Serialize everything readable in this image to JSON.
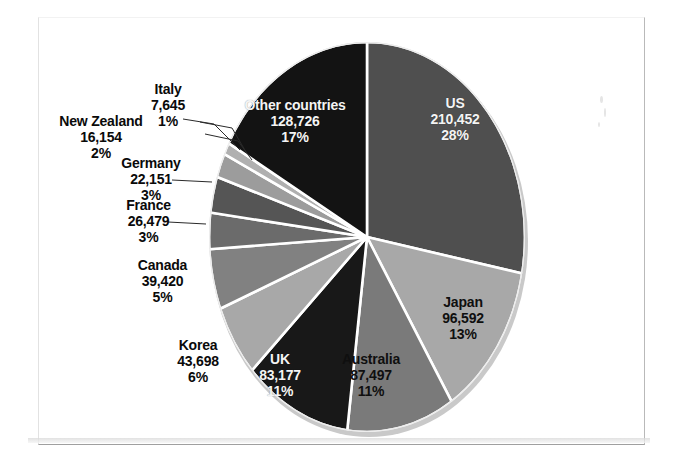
{
  "chart_data": {
    "type": "pie",
    "title": "",
    "subtitle": "",
    "xlabel": "",
    "ylabel": "",
    "legend_position": "none",
    "grid": false,
    "label_format": "name, value, percent",
    "total": 762011,
    "categories": [
      "US",
      "Japan",
      "Australia",
      "UK",
      "Korea",
      "Canada",
      "France",
      "Germany",
      "New Zealand",
      "Italy",
      "Other countries"
    ],
    "values": [
      210452,
      96592,
      87497,
      83177,
      43698,
      39420,
      26479,
      22151,
      16154,
      7645,
      128726
    ],
    "percents": [
      28,
      13,
      11,
      11,
      6,
      5,
      3,
      3,
      2,
      1,
      17
    ],
    "slices": [
      {
        "name": "US",
        "value": "210,452",
        "percent": "28%",
        "number": 210452,
        "pct": 28,
        "color": "#4f4f4f",
        "label_placement": "inside"
      },
      {
        "name": "Japan",
        "value": "96,592",
        "percent": "13%",
        "number": 96592,
        "pct": 13,
        "color": "#a8a8a8",
        "label_placement": "inside"
      },
      {
        "name": "Australia",
        "value": "87,497",
        "percent": "11%",
        "number": 87497,
        "pct": 11,
        "color": "#7a7a7a",
        "label_placement": "inside"
      },
      {
        "name": "UK",
        "value": "83,177",
        "percent": "11%",
        "number": 83177,
        "pct": 11,
        "color": "#181818",
        "label_placement": "inside"
      },
      {
        "name": "Korea",
        "value": "43,698",
        "percent": "6%",
        "number": 43698,
        "pct": 6,
        "color": "#a8a8a8",
        "label_placement": "outside"
      },
      {
        "name": "Canada",
        "value": "39,420",
        "percent": "5%",
        "number": 39420,
        "pct": 5,
        "color": "#818181",
        "label_placement": "outside"
      },
      {
        "name": "France",
        "value": "26,479",
        "percent": "3%",
        "number": 26479,
        "pct": 3,
        "color": "#6b6b6b",
        "label_placement": "outside"
      },
      {
        "name": "Germany",
        "value": "22,151",
        "percent": "3%",
        "number": 22151,
        "pct": 3,
        "color": "#555555",
        "label_placement": "outside"
      },
      {
        "name": "New Zealand",
        "value": "16,154",
        "percent": "2%",
        "number": 16154,
        "pct": 2,
        "color": "#9c9c9c",
        "label_placement": "outside"
      },
      {
        "name": "Italy",
        "value": "7,645",
        "percent": "1%",
        "number": 7645,
        "pct": 1,
        "color": "#b0b0b0",
        "label_placement": "outside"
      },
      {
        "name": "Other countries",
        "value": "128,726",
        "percent": "17%",
        "number": 128726,
        "pct": 17,
        "color": "#131313",
        "label_placement": "inside"
      }
    ]
  }
}
